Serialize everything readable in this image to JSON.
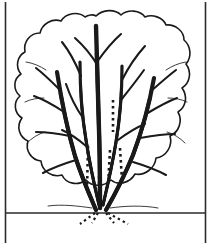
{
  "page": {
    "title": "Tree Coloring Page",
    "background_color": "#ffffff",
    "ink_color": "#1a1a1a",
    "width": 211,
    "height": 245
  },
  "frame": {
    "name": "page-border",
    "left_rule_x": 5.5,
    "right_rule_x": 205.5,
    "top_y": 2,
    "bottom_y": 243,
    "stroke_width": 1.6,
    "color": "#2b2b2b"
  },
  "ground": {
    "name": "ground-line",
    "y": 213,
    "x_start": 6,
    "x_end": 205,
    "stroke_width": 1.3,
    "color": "#2b2b2b"
  },
  "artwork": {
    "subject": "tree",
    "style": "black-and-white line art",
    "canopy": {
      "name": "foliage-outline",
      "description": "scalloped cloud-like bush canopy",
      "stroke_width": 1.6,
      "fill": "#ffffff",
      "path": "M 96 16 C 103 9, 115 9, 121 15 C 128 9, 140 10, 145 17 C 152 14, 163 17, 166 25 C 175 24, 184 31, 184 40 C 191 46, 192 57, 186 64 C 192 72, 190 83, 182 88 C 188 96, 186 107, 178 112 C 183 121, 179 132, 170 136 C 173 146, 166 157, 156 158 C 155 168, 145 176, 135 174 C 130 183, 118 186, 111 180 C 104 187, 92 187, 86 180 C 78 186, 66 184, 62 175 C 52 178, 42 171, 41 161 C 31 160, 25 150, 28 141 C 19 137, 16 126, 22 118 C 14 113, 13 102, 20 96 C 13 90, 13 79, 21 74 C 15 67, 17 56, 25 52 C 23 42, 30 33, 40 33 C 42 24, 52 18, 61 21 C 66 13, 78 11, 85 17 C 88 15, 93 14, 96 16 Z"
    },
    "trunks": [
      {
        "name": "trunk-center",
        "d": "M 100 208 C 100 190, 100 160, 99 130 C 98 100, 97 64, 96 26",
        "width_base": 4.4,
        "width_tip": 0.9
      },
      {
        "name": "trunk-left",
        "d": "M 96 210 C 90 196, 82 178, 75 156 C 68 132, 62 104, 57 72",
        "width_base": 4.2,
        "width_tip": 0.9
      },
      {
        "name": "trunk-right",
        "d": "M 106 210 C 114 196, 124 177, 133 155 C 142 131, 149 106, 154 78",
        "width_base": 4.2,
        "width_tip": 0.9
      },
      {
        "name": "trunk-inner-left",
        "d": "M 99 205 C 95 188, 90 166, 86 140 C 82 116, 80 92, 80 62",
        "width_base": 3.2,
        "width_tip": 0.8
      },
      {
        "name": "trunk-inner-right",
        "d": "M 103 205 C 107 188, 112 167, 116 142 C 120 118, 122 94, 122 66",
        "width_base": 3.2,
        "width_tip": 0.8
      }
    ],
    "branches": [
      {
        "name": "branch-left-1",
        "d": "M 60 90 C 52 82, 44 74, 36 68"
      },
      {
        "name": "branch-left-2",
        "d": "M 64 112 C 55 106, 45 100, 34 96"
      },
      {
        "name": "branch-left-3",
        "d": "M 70 136 C 60 134, 48 132, 36 132"
      },
      {
        "name": "branch-left-4",
        "d": "M 76 160 C 66 163, 54 167, 43 173"
      },
      {
        "name": "branch-left-5",
        "d": "M 83 118 C 76 108, 70 96, 66 84"
      },
      {
        "name": "branch-left-6",
        "d": "M 86 146 C 79 140, 71 134, 62 130"
      },
      {
        "name": "branch-inner-left-up",
        "d": "M 81 76 C 76 64, 70 52, 62 42"
      },
      {
        "name": "branch-center-left",
        "d": "M 98 66 C 92 56, 84 46, 75 38"
      },
      {
        "name": "branch-center-right",
        "d": "M 97 62 C 104 52, 112 42, 121 34"
      },
      {
        "name": "branch-right-1",
        "d": "M 150 92 C 159 84, 168 76, 176 70"
      },
      {
        "name": "branch-right-2",
        "d": "M 146 114 C 156 108, 166 102, 177 98"
      },
      {
        "name": "branch-right-3",
        "d": "M 140 138 C 151 136, 163 134, 175 134"
      },
      {
        "name": "branch-right-4",
        "d": "M 133 162 C 143 165, 155 169, 166 175"
      },
      {
        "name": "branch-right-5",
        "d": "M 121 100 C 129 90, 137 80, 144 70"
      },
      {
        "name": "branch-right-6",
        "d": "M 118 140 C 126 134, 135 128, 145 124"
      },
      {
        "name": "branch-inner-right-up",
        "d": "M 122 80 C 128 68, 136 56, 145 46"
      },
      {
        "name": "vein-thin-left-a",
        "d": "M 46 70 C 40 66, 33 63, 26 62"
      },
      {
        "name": "vein-thin-left-b",
        "d": "M 44 98 C 38 98, 31 99, 25 102"
      },
      {
        "name": "vein-thin-left-c",
        "d": "M 45 132 C 38 134, 32 138, 27 143"
      },
      {
        "name": "vein-thin-right-a",
        "d": "M 166 70 C 172 66, 179 63, 186 62"
      },
      {
        "name": "vein-thin-right-b",
        "d": "M 168 98 C 174 98, 181 99, 187 102"
      },
      {
        "name": "vein-thin-right-c",
        "d": "M 167 132 C 174 134, 180 138, 185 143"
      },
      {
        "name": "vein-base-left",
        "d": "M 92 208 C 78 206, 62 204, 48 206"
      },
      {
        "name": "vein-base-right",
        "d": "M 110 208 C 124 206, 142 205, 158 208"
      }
    ],
    "dotted_accents": [
      {
        "name": "dot-line-center-upper",
        "d": "M 113 100 L 113 132",
        "dash": "2.6 3.4",
        "width": 2.6
      },
      {
        "name": "dot-line-center-lower",
        "d": "M 110 150 L 108 186",
        "dash": "2.6 3.4",
        "width": 2.6
      },
      {
        "name": "dot-line-left-stem",
        "d": "M 88 146 L 87 190",
        "dash": "2.6 3.4",
        "width": 2.6
      },
      {
        "name": "dot-line-right-stem",
        "d": "M 120 148 L 122 180",
        "dash": "2.6 3.4",
        "width": 2.6
      },
      {
        "name": "dot-line-inner-short",
        "d": "M 99 176 L 99 196",
        "dash": "2.6 3.4",
        "width": 2.4
      }
    ],
    "roots": [
      {
        "name": "root-far-left",
        "d": "M 95 213 L 80 224",
        "dash": "2.4 3.2",
        "width": 2.2
      },
      {
        "name": "root-left",
        "d": "M 98 213 L 92 223",
        "dash": "2.4 3.2",
        "width": 2.2
      },
      {
        "name": "root-right",
        "d": "M 106 213 L 114 223",
        "dash": "2.4 3.2",
        "width": 2.2
      },
      {
        "name": "root-far-right",
        "d": "M 108 213 L 128 224",
        "dash": "2.4 3.2",
        "width": 2.2
      }
    ]
  }
}
